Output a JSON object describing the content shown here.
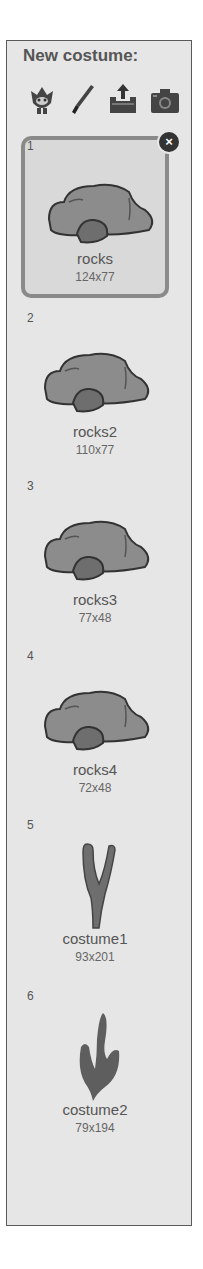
{
  "panel": {
    "header": "New costume:",
    "tools": [
      {
        "name": "choose-from-library",
        "icon": "sprite-library-icon"
      },
      {
        "name": "paint-new",
        "icon": "paintbrush-icon"
      },
      {
        "name": "upload-from-file",
        "icon": "upload-icon"
      },
      {
        "name": "new-from-camera",
        "icon": "camera-icon"
      }
    ]
  },
  "costumes": [
    {
      "num": "1",
      "name": "rocks",
      "size": "124x77",
      "selected": true,
      "type": "rock"
    },
    {
      "num": "2",
      "name": "rocks2",
      "size": "110x77",
      "selected": false,
      "type": "rock"
    },
    {
      "num": "3",
      "name": "rocks3",
      "size": "77x48",
      "selected": false,
      "type": "rock"
    },
    {
      "num": "4",
      "name": "rocks4",
      "size": "72x48",
      "selected": false,
      "type": "rock"
    },
    {
      "num": "5",
      "name": "costume1",
      "size": "93x201",
      "selected": false,
      "type": "branch"
    },
    {
      "num": "6",
      "name": "costume2",
      "size": "79x194",
      "selected": false,
      "type": "flame"
    }
  ],
  "delete_icon": "×",
  "colors": {
    "panel_bg": "#e6e6e6",
    "rock_fill": "#8c8c8c",
    "rock_small": "#6e6e6e",
    "stroke": "#333333"
  }
}
